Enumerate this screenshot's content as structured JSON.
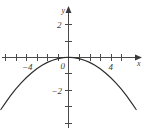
{
  "figure": {
    "background_color": "#ffffff",
    "curve_color": "#2b2b2b",
    "axis_color": "#4a4a4a",
    "label_color": "#3a3a3a"
  },
  "chart_data": {
    "type": "line",
    "title": "",
    "subtitle": "",
    "xlabel": "x",
    "ylabel": "y",
    "grid": false,
    "legend": null,
    "xlim": [
      -6.4,
      7.4
    ],
    "ylim": [
      -4.5,
      2.6
    ],
    "x_ticks": [
      -6,
      -5,
      -4,
      -3,
      -2,
      -1,
      1,
      2,
      3,
      4,
      5,
      6
    ],
    "x_tick_labels": [
      "",
      "",
      "-4",
      "",
      "",
      "",
      "",
      "",
      "",
      "4",
      "",
      ""
    ],
    "y_ticks": [
      -4,
      -3,
      -2,
      -1,
      1,
      2
    ],
    "y_tick_labels": [
      "",
      "",
      "-2",
      "",
      "",
      "2"
    ],
    "origin_label": "0",
    "annotations": [],
    "series": [
      {
        "name": "parabola",
        "equation": "y = -0.078 x^2",
        "vertex": [
          0,
          0
        ],
        "opens": "down",
        "x": [
          -6.4,
          -6.0,
          -5.5,
          -5.0,
          -4.5,
          -4.0,
          -3.5,
          -3.0,
          -2.5,
          -2.0,
          -1.5,
          -1.0,
          -0.5,
          0.0,
          0.5,
          1.0,
          1.5,
          2.0,
          2.5,
          3.0,
          3.5,
          4.0,
          4.5,
          5.0,
          5.5,
          6.0,
          6.4
        ],
        "y": [
          -3.19,
          -2.81,
          -2.36,
          -1.95,
          -1.58,
          -1.25,
          -0.96,
          -0.7,
          -0.49,
          -0.31,
          -0.18,
          -0.08,
          -0.02,
          0.0,
          -0.02,
          -0.08,
          -0.18,
          -0.31,
          -0.49,
          -0.7,
          -0.96,
          -1.25,
          -1.58,
          -1.95,
          -2.36,
          -2.81,
          -3.19
        ]
      }
    ]
  },
  "labels": {
    "y_axis_name": "y",
    "x_axis_name": "x",
    "y_tick_2": "2",
    "y_tick_neg2": "−2",
    "x_tick_4": "4",
    "x_tick_neg4": "−4",
    "origin": "0"
  }
}
